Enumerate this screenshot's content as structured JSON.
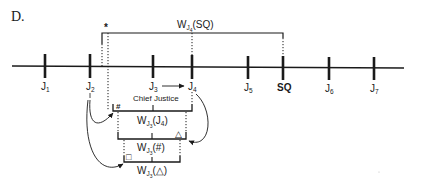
{
  "figure": {
    "panel_label": "D.",
    "colors": {
      "ink": "#1a1a1a",
      "background": "#ffffff"
    }
  },
  "timeline": {
    "ticks": [
      {
        "id": "J1",
        "base": "J",
        "sub": "1",
        "x": 45
      },
      {
        "id": "J2",
        "base": "J",
        "sub": "2",
        "x": 90
      },
      {
        "id": "J3",
        "base": "J",
        "sub": "3",
        "x": 153
      },
      {
        "id": "J4",
        "base": "J",
        "sub": "4",
        "x": 192
      },
      {
        "id": "J5",
        "base": "J",
        "sub": "5",
        "x": 248
      },
      {
        "id": "SQ",
        "base": "SQ",
        "sub": "",
        "x": 283,
        "bold": true
      },
      {
        "id": "J6",
        "base": "J",
        "sub": "6",
        "x": 329
      },
      {
        "id": "J7",
        "base": "J",
        "sub": "7",
        "x": 374
      }
    ],
    "arrow_J3_to_J4": true,
    "arrow_caption": "Chief Justice"
  },
  "top_bracket": {
    "label_w": "W",
    "label_sub": "J",
    "label_subsub": "4",
    "label_arg": "(SQ)",
    "marker": "*"
  },
  "brackets": [
    {
      "label_w": "W",
      "label_sub": "J",
      "label_subsub": "3",
      "label_arg": "(J",
      "label_arg_sub": "4",
      "label_close": ")",
      "marker": "#",
      "marker_side": "left"
    },
    {
      "label_w": "W",
      "label_sub": "J",
      "label_subsub": "3",
      "label_arg": "(#)",
      "marker": "△",
      "marker_side": "right"
    },
    {
      "label_w": "W",
      "label_sub": "J",
      "label_subsub": "3",
      "label_arg": "(△)",
      "marker": "□",
      "marker_side": "left"
    }
  ]
}
